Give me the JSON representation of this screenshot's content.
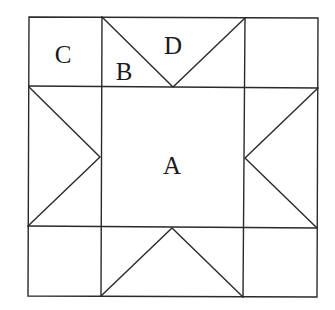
{
  "diagram": {
    "type": "quilt-block",
    "colors": {
      "background": "#ffffff",
      "line": "#2a2a2a",
      "text": "#1a1a1a"
    },
    "grid": {
      "x": [
        29,
        101,
        244,
        317
      ],
      "y": [
        17,
        87,
        227,
        297
      ]
    },
    "labels": {
      "A": "A",
      "B": "B",
      "C": "C",
      "D": "D"
    },
    "regions": [
      {
        "id": "A",
        "shape": "center-square"
      },
      {
        "id": "B",
        "shape": "small-triangle"
      },
      {
        "id": "C",
        "shape": "corner-square"
      },
      {
        "id": "D",
        "shape": "large-triangle"
      }
    ]
  }
}
